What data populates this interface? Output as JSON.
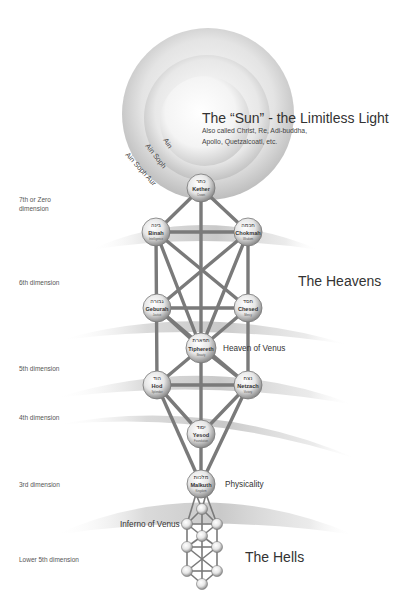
{
  "title": {
    "main": "The “Sun” - the Limitless Light",
    "subtitle_line1": "Also called Christ, Re, Adi-buddha,",
    "subtitle_line2": "Apollo, Quetzalcoatl, etc."
  },
  "rings": {
    "inner": "Ain",
    "middle": "Ain Soph",
    "outer": "Ain Soph Aur"
  },
  "dimensions": [
    {
      "line1": "7th or Zero",
      "line2": "dimension"
    },
    {
      "line1": "6th dimension",
      "line2": ""
    },
    {
      "line1": "5th dimension",
      "line2": ""
    },
    {
      "line1": "4th dimension",
      "line2": ""
    },
    {
      "line1": "3rd dimension",
      "line2": ""
    },
    {
      "line1": "Lower 5th dimension",
      "line2": ""
    }
  ],
  "regions": {
    "heavens": "The Heavens",
    "heaven_of_venus": "Heaven of Venus",
    "physicality": "Physicality",
    "inferno_of_venus": "Inferno of Venus",
    "hells": "The Hells"
  },
  "sephiroth": [
    {
      "name": "Kether",
      "meaning": "Crown",
      "hebrew": "כתר"
    },
    {
      "name": "Binah",
      "meaning": "Intelligence",
      "hebrew": "בינה"
    },
    {
      "name": "Chokmah",
      "meaning": "Wisdom",
      "hebrew": "חכמה"
    },
    {
      "name": "Geburah",
      "meaning": "Justice",
      "hebrew": "גבורה"
    },
    {
      "name": "Chesed",
      "meaning": "Mercy",
      "hebrew": "חסד"
    },
    {
      "name": "Tiphereth",
      "meaning": "Beauty",
      "hebrew": "תפארת"
    },
    {
      "name": "Hod",
      "meaning": "Splendor",
      "hebrew": "הוד"
    },
    {
      "name": "Netzach",
      "meaning": "Victory",
      "hebrew": "נצח"
    },
    {
      "name": "Yesod",
      "meaning": "Foundation",
      "hebrew": "יסוד"
    },
    {
      "name": "Malkuth",
      "meaning": "Kingdom",
      "hebrew": "מלכות"
    }
  ],
  "colors": {
    "path": "#7a7a7a",
    "node_light": "#f4f4f4",
    "node_dark": "#8a8a8a",
    "band": "#c8c8c8",
    "text": "#333333"
  }
}
